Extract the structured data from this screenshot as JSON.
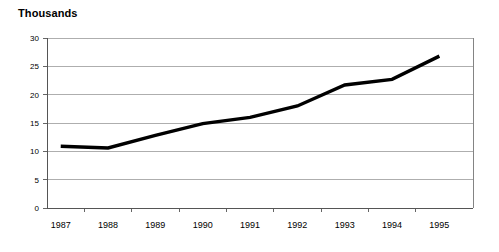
{
  "chart_data": {
    "type": "line",
    "title": "Thousands",
    "xlabel": "",
    "ylabel": "",
    "categories": [
      "1987",
      "1988",
      "1989",
      "1990",
      "1991",
      "1992",
      "1993",
      "1994",
      "1995"
    ],
    "values": [
      10.9,
      10.6,
      12.8,
      14.9,
      16.0,
      18.0,
      21.7,
      22.7,
      26.8
    ],
    "series": [
      {
        "name": "Thousands",
        "values": [
          10.9,
          10.6,
          12.8,
          14.9,
          16.0,
          18.0,
          21.7,
          22.7,
          26.8
        ]
      }
    ],
    "ylim": [
      0,
      30
    ],
    "y_ticks": [
      0,
      5,
      10,
      15,
      20,
      25,
      30
    ],
    "y_tick_labels": [
      "0",
      "5",
      "10",
      "15",
      "20",
      "25",
      "30"
    ],
    "grid": true,
    "grid_axis": "y",
    "legend": false,
    "legend_position": "none",
    "line_color": "#000000",
    "gridline_color": "#9a9a9a",
    "axis_color": "#555555",
    "background_color": "#ffffff",
    "markers": false
  }
}
